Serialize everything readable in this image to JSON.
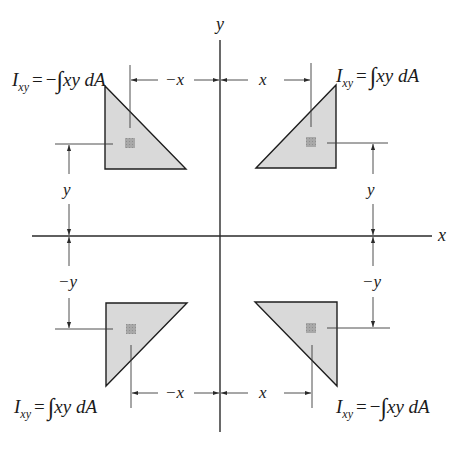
{
  "diagram": {
    "type": "product-of-inertia-sign-convention",
    "colors": {
      "axis": "#2a2a2a",
      "triangle_fill": "#d9d9d9",
      "triangle_stroke": "#1e1e1e",
      "element_fill": "#a8a8a8",
      "dimension_line": "#3a3a3a"
    },
    "axes": {
      "x_label": "x",
      "y_label": "y"
    },
    "dimensions": {
      "top_left": "−x",
      "top_right": "x",
      "bottom_left": "−x",
      "bottom_right": "x",
      "left_upper": "y",
      "left_lower": "−y",
      "right_upper": "y",
      "right_lower": "−y"
    },
    "quadrants": [
      {
        "position": "top-left",
        "formula": {
          "I": "I",
          "sub": "xy",
          "eq": "=",
          "sign": "−",
          "integral": "∫",
          "body": "xy dA"
        }
      },
      {
        "position": "top-right",
        "formula": {
          "I": "I",
          "sub": "xy",
          "eq": "=",
          "sign": "",
          "integral": "∫",
          "body": "xy dA"
        }
      },
      {
        "position": "bottom-left",
        "formula": {
          "I": "I",
          "sub": "xy",
          "eq": "=",
          "sign": "",
          "integral": "∫",
          "body": "xy dA"
        }
      },
      {
        "position": "bottom-right",
        "formula": {
          "I": "I",
          "sub": "xy",
          "eq": "=",
          "sign": "−",
          "integral": "∫",
          "body": "xy dA"
        }
      }
    ]
  }
}
